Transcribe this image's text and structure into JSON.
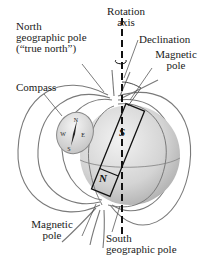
{
  "labels": {
    "north_geo_line1": "North",
    "north_geo_line2": "geographic pole",
    "north_geo_line3": "(“true north”)",
    "rotation_line1": "Rotation",
    "rotation_line2": "axis",
    "declination": "Declination",
    "magnetic_pole_top_line1": "Magnetic",
    "magnetic_pole_top_line2": "pole",
    "compass": "Compass",
    "magnetic_pole_bottom_line1": "Magnetic",
    "magnetic_pole_bottom_line2": "pole",
    "south_geo_line1": "South",
    "south_geo_line2": "geographic pole"
  },
  "magnet": {
    "top_letter": "S",
    "bottom_letter": "N"
  },
  "compass_face": {
    "n": "N",
    "e": "E",
    "s": "S",
    "w": "W"
  },
  "colors": {
    "field_line": "#7a7a7a",
    "globe_light": "#e4e4e4",
    "globe_dark": "#b5b5b5",
    "axis": "#111111"
  }
}
